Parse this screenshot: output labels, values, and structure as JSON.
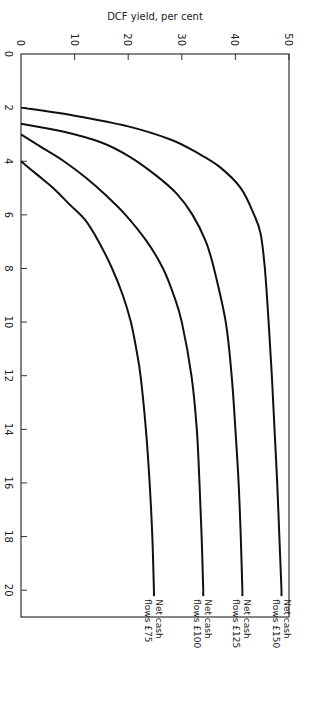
{
  "chart_data": {
    "type": "line",
    "title": "",
    "xlabel": "Life in years",
    "ylabel": "DCF yield, per cent",
    "xlim": [
      0,
      21
    ],
    "ylim": [
      0,
      50
    ],
    "xticks": [
      0,
      2,
      4,
      6,
      8,
      10,
      12,
      14,
      16,
      18,
      20
    ],
    "yticks": [
      0,
      10,
      20,
      30,
      40,
      50
    ],
    "grid": false,
    "orientation_in_image": "rotated 90 degrees clockwise",
    "series": [
      {
        "name": "Net cash flows £150",
        "label_lines": [
          "Net  cash",
          "flows £150"
        ],
        "x": [
          2.0,
          2.3,
          2.7,
          3.2,
          3.7,
          4.2,
          5,
          6,
          6.7,
          8,
          10,
          12,
          14,
          16,
          18,
          20
        ],
        "y": [
          0,
          10,
          20,
          28,
          33,
          37,
          41,
          43.5,
          44.7,
          45.5,
          46.2,
          46.8,
          47.3,
          47.8,
          48.2,
          48.6
        ]
      },
      {
        "name": "Net cash flows £125",
        "label_lines": [
          "Net  cash",
          "flows £125"
        ],
        "x": [
          2.6,
          2.9,
          3.3,
          3.8,
          4.5,
          5.2,
          6,
          7,
          8,
          10,
          12,
          14,
          16,
          18,
          20
        ],
        "y": [
          0,
          8,
          15,
          20,
          25,
          29,
          32,
          34.5,
          36,
          38.2,
          39.3,
          40,
          40.6,
          41,
          41.3
        ]
      },
      {
        "name": "Net cash flows £100",
        "label_lines": [
          "Net  cash",
          "flows £100"
        ],
        "x": [
          3.0,
          3.5,
          4.0,
          4.6,
          5.3,
          6,
          7,
          8,
          9,
          10,
          12,
          14,
          16,
          18,
          20
        ],
        "y": [
          0,
          4,
          8,
          12,
          16,
          19.5,
          23.5,
          26.5,
          28.5,
          30,
          31.8,
          32.8,
          33.3,
          33.7,
          34
        ]
      },
      {
        "name": "Net cash flows £75",
        "label_lines": [
          "Net  cash",
          "flows £75"
        ],
        "x": [
          4.0,
          4.5,
          5.0,
          5.6,
          6.2,
          7,
          8,
          9,
          10,
          11,
          12,
          14,
          16,
          18,
          20
        ],
        "y": [
          0,
          3,
          6,
          9,
          12,
          14.5,
          17,
          19,
          20.5,
          21.5,
          22.3,
          23.3,
          24,
          24.5,
          24.8
        ]
      }
    ]
  }
}
